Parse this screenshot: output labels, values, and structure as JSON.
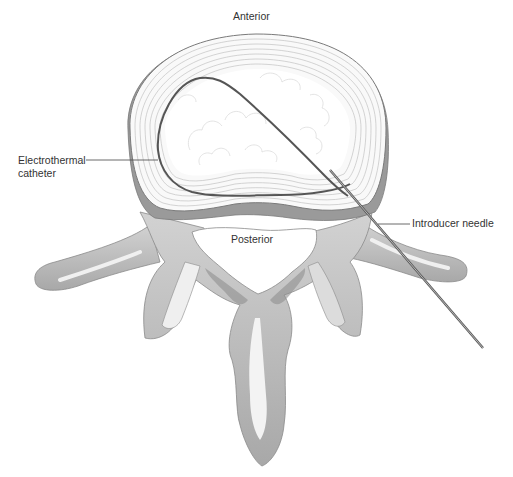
{
  "figure": {
    "type": "anatomical illustration"
  },
  "labels": {
    "anterior": "Anterior",
    "posterior": "Posterior",
    "catheter_line1": "Electrothermal",
    "catheter_line2": "catheter",
    "needle": "Introducer needle"
  },
  "colors": {
    "background": "#ffffff",
    "bone_fill": "#c4c4c4",
    "bone_shadow": "#9a9a9a",
    "bone_highlight": "#eeeeee",
    "disc_annulus": "#f7f7f7",
    "annulus_rings": "#b8b8b8",
    "nucleus": "#ffffff",
    "catheter": "#555555",
    "needle": "#666666",
    "text": "#333333"
  }
}
